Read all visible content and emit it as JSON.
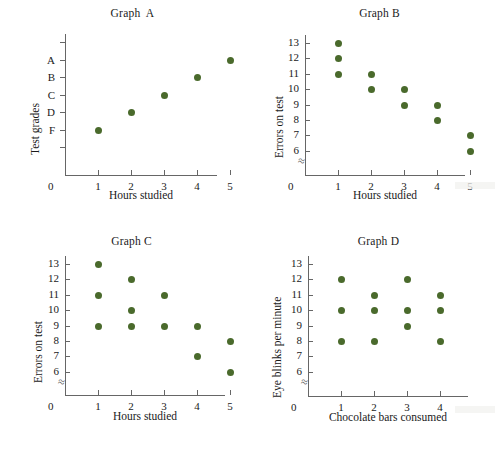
{
  "page": {
    "background": "#ffffff",
    "dot_color": "#4a6a2c",
    "axis_color": "#666666",
    "text_color": "#1a1a1a"
  },
  "chart_data": [
    {
      "id": "graph-a",
      "type": "scatter",
      "title": "Graph  A",
      "xlabel": "Hours studied",
      "ylabel": "Test grades",
      "origin_label": "0",
      "xticks": [
        "1",
        "2",
        "3",
        "4",
        "5"
      ],
      "yticks": [
        "A",
        "B",
        "C",
        "D",
        "F"
      ],
      "ytick_slots": 7,
      "ylabel_slots": [
        1,
        2,
        3,
        4,
        5
      ],
      "axis_break": false,
      "grid": false,
      "legend": null,
      "points": [
        {
          "x": 1,
          "y": "F"
        },
        {
          "x": 2,
          "y": "D"
        },
        {
          "x": 3,
          "y": "C"
        },
        {
          "x": 4,
          "y": "B"
        },
        {
          "x": 5,
          "y": "A"
        }
      ]
    },
    {
      "id": "graph-b",
      "type": "scatter",
      "title": "Graph B",
      "xlabel": "Hours studied",
      "ylabel": "Errors on test",
      "origin_label": "0",
      "xticks": [
        "1",
        "2",
        "3",
        "4",
        "5"
      ],
      "yticks": [
        "13",
        "12",
        "11",
        "10",
        "9",
        "8",
        "7",
        "6"
      ],
      "axis_break": true,
      "grid": false,
      "legend": null,
      "points": [
        {
          "x": 1,
          "y": 13
        },
        {
          "x": 1,
          "y": 12
        },
        {
          "x": 1,
          "y": 11
        },
        {
          "x": 2,
          "y": 11
        },
        {
          "x": 2,
          "y": 10
        },
        {
          "x": 3,
          "y": 10
        },
        {
          "x": 3,
          "y": 9
        },
        {
          "x": 4,
          "y": 9
        },
        {
          "x": 4,
          "y": 8
        },
        {
          "x": 5,
          "y": 7
        },
        {
          "x": 5,
          "y": 6
        }
      ]
    },
    {
      "id": "graph-c",
      "type": "scatter",
      "title": "Graph C",
      "xlabel": "Hours studied",
      "ylabel": "Errors on test",
      "origin_label": "0",
      "xticks": [
        "1",
        "2",
        "3",
        "4",
        "5"
      ],
      "yticks": [
        "13",
        "12",
        "11",
        "10",
        "9",
        "8",
        "7",
        "6"
      ],
      "axis_break": true,
      "grid": false,
      "legend": null,
      "points": [
        {
          "x": 1,
          "y": 13
        },
        {
          "x": 1,
          "y": 11
        },
        {
          "x": 1,
          "y": 9
        },
        {
          "x": 2,
          "y": 12
        },
        {
          "x": 2,
          "y": 10
        },
        {
          "x": 2,
          "y": 9
        },
        {
          "x": 3,
          "y": 11
        },
        {
          "x": 3,
          "y": 9
        },
        {
          "x": 4,
          "y": 9
        },
        {
          "x": 4,
          "y": 7
        },
        {
          "x": 5,
          "y": 8
        },
        {
          "x": 5,
          "y": 6
        }
      ]
    },
    {
      "id": "graph-d",
      "type": "scatter",
      "title": "Graph D",
      "xlabel": "Chocolate bars consumed",
      "ylabel": "Eye blinks per minute",
      "origin_label": "0",
      "xticks": [
        "1",
        "2",
        "3",
        "4"
      ],
      "yticks": [
        "13",
        "12",
        "11",
        "10",
        "9",
        "8",
        "7",
        "6"
      ],
      "axis_break": true,
      "grid": false,
      "legend": null,
      "points": [
        {
          "x": 1,
          "y": 12
        },
        {
          "x": 1,
          "y": 10
        },
        {
          "x": 1,
          "y": 8
        },
        {
          "x": 2,
          "y": 11
        },
        {
          "x": 2,
          "y": 10
        },
        {
          "x": 2,
          "y": 8
        },
        {
          "x": 3,
          "y": 12
        },
        {
          "x": 3,
          "y": 10
        },
        {
          "x": 3,
          "y": 9
        },
        {
          "x": 4,
          "y": 11
        },
        {
          "x": 4,
          "y": 10
        },
        {
          "x": 4,
          "y": 8
        }
      ]
    }
  ]
}
